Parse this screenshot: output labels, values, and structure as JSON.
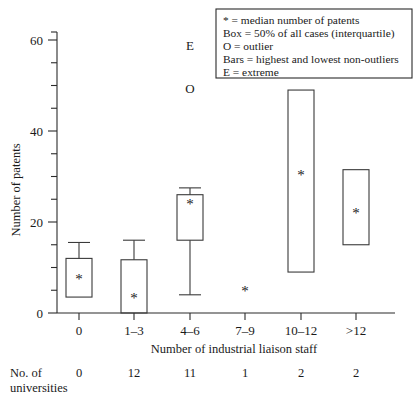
{
  "chart_data": {
    "type": "box",
    "title": "",
    "xlabel": "Number of industrial liaison staff",
    "ylabel": "Number of patents",
    "ylim": [
      0,
      63
    ],
    "yticks_labeled": [
      0,
      20,
      40,
      60
    ],
    "ytick_interval_minor": 5,
    "grid": false,
    "categories": [
      "0",
      "1–3",
      "4–6",
      "7–9",
      "10–12",
      ">12"
    ],
    "series": [
      {
        "name": "0",
        "whisker_low": null,
        "box_low": 3.5,
        "median": 7.5,
        "box_high": 12,
        "whisker_high": 15.5,
        "extremes": [],
        "outliers": []
      },
      {
        "name": "1–3",
        "whisker_low": null,
        "box_low": 0,
        "median": 3.5,
        "box_high": 11.7,
        "whisker_high": 16,
        "extremes": [],
        "outliers": []
      },
      {
        "name": "4–6",
        "whisker_low": 4,
        "box_low": 16,
        "median": 24,
        "box_high": 26,
        "whisker_high": 27.5,
        "extremes": [
          59
        ],
        "outliers": [
          49.5
        ]
      },
      {
        "name": "7–9",
        "whisker_low": null,
        "box_low": null,
        "median": 5,
        "box_high": null,
        "whisker_high": null,
        "extremes": [],
        "outliers": []
      },
      {
        "name": "10–12",
        "whisker_low": null,
        "box_low": 9,
        "median": 30.5,
        "box_high": 49,
        "whisker_high": null,
        "extremes": [],
        "outliers": []
      },
      {
        "name": ">12",
        "whisker_low": null,
        "box_low": 15,
        "median": 22,
        "box_high": 31.5,
        "whisker_high": null,
        "extremes": [],
        "outliers": []
      }
    ],
    "legend": {
      "position": "top-right",
      "entries": [
        "* = median number of patents",
        "Box = 50% of all cases (interquartile)",
        "O = outlier",
        "Bars = highest and lowest non-outliers",
        "E = extreme"
      ]
    },
    "marker_labels": {
      "extreme": "E",
      "outlier": "O",
      "median": "*"
    },
    "footer": {
      "label_line1": "No. of",
      "label_line2": "universities",
      "values": [
        "0",
        "12",
        "11",
        "1",
        "2",
        "2"
      ]
    },
    "colors": {
      "stroke": "#2b2b2b",
      "box_stroke": "#3a3a3a",
      "background": "#ffffff",
      "text": "#1a1a1a"
    }
  }
}
